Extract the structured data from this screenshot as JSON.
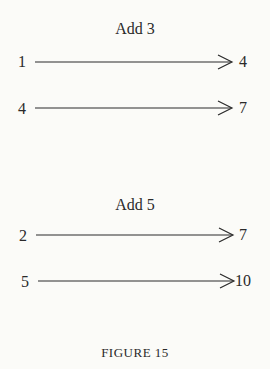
{
  "groups": [
    {
      "title": "Add 3",
      "rows": [
        {
          "from": "1",
          "to": "4"
        },
        {
          "from": "4",
          "to": "7"
        }
      ]
    },
    {
      "title": "Add 5",
      "rows": [
        {
          "from": "2",
          "to": "7"
        },
        {
          "from": "5",
          "to": "10"
        }
      ]
    }
  ],
  "caption": "FIGURE 15",
  "colors": {
    "ink": "#2a2a2a",
    "paper": "#fbfbf8"
  }
}
